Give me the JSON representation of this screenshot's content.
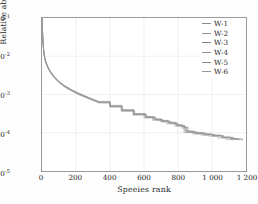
{
  "chart_data": {
    "type": "line",
    "title": "",
    "xlabel": "Speeies rank",
    "ylabel": "Relative abundance",
    "xlim": [
      0,
      1200
    ],
    "ylim": [
      1e-05,
      0.1
    ],
    "yscale": "log",
    "xscale": "linear",
    "grid": true,
    "legend_position": "upper-right",
    "xticks": [
      "0",
      "200",
      "400",
      "600",
      "800",
      "1 000",
      "1 200"
    ],
    "xtick_values": [
      0,
      200,
      400,
      600,
      800,
      1000,
      1200
    ],
    "ytick_exponents": [
      "-1",
      "-2",
      "-3",
      "-4",
      "-5"
    ],
    "ytick_values": [
      0.1,
      0.01,
      0.001,
      0.0001,
      1e-05
    ],
    "line_color": "#8d8d8d",
    "series": [
      {
        "name": "W-1",
        "color": "#8a8a8a",
        "x": [
          1,
          3,
          6,
          10,
          16,
          24,
          36,
          52,
          72,
          100,
          135,
          175,
          220,
          275,
          335,
          400,
          470,
          540,
          610,
          660,
          700,
          745,
          790,
          830,
          845,
          900,
          960,
          1000,
          1060,
          1120,
          1180
        ],
        "y": [
          0.098,
          0.045,
          0.024,
          0.0138,
          0.0092,
          0.0068,
          0.0051,
          0.0038,
          0.0029,
          0.00215,
          0.00165,
          0.0013,
          0.00104,
          0.00082,
          0.00064,
          0.0005,
          0.00039,
          0.00031,
          0.00026,
          0.000225,
          0.000205,
          0.000182,
          0.000158,
          0.000142,
          0.000108,
          9.85e-05,
          9.15e-05,
          8.55e-05,
          7.6e-05,
          6.9e-05,
          6.4e-05
        ]
      },
      {
        "name": "W-2",
        "color": "#909090",
        "x": [
          1,
          3,
          6,
          10,
          16,
          24,
          36,
          52,
          72,
          100,
          135,
          175,
          220,
          275,
          335,
          400,
          470,
          540,
          610,
          665,
          705,
          750,
          795,
          835,
          855,
          905,
          955,
          1010,
          1070,
          1130,
          1175
        ],
        "y": [
          0.097,
          0.043,
          0.0232,
          0.0133,
          0.0089,
          0.0066,
          0.0049,
          0.0037,
          0.00283,
          0.0021,
          0.0016,
          0.00127,
          0.00101,
          0.0008,
          0.00062,
          0.000485,
          0.000378,
          0.0003,
          0.000252,
          0.000218,
          0.000198,
          0.000176,
          0.000153,
          0.000137,
          0.000104,
          9.55e-05,
          8.9e-05,
          8.3e-05,
          7.45e-05,
          6.8e-05,
          6.35e-05
        ]
      },
      {
        "name": "W-3",
        "color": "#878787",
        "x": [
          1,
          3,
          6,
          10,
          16,
          24,
          36,
          52,
          72,
          100,
          135,
          175,
          220,
          275,
          335,
          400,
          470,
          540,
          605,
          655,
          700,
          740,
          785,
          825,
          840,
          890,
          945,
          995,
          1050,
          1105,
          1150
        ],
        "y": [
          0.1,
          0.047,
          0.0247,
          0.0142,
          0.0095,
          0.007,
          0.0052,
          0.00392,
          0.00298,
          0.0022,
          0.0017,
          0.00134,
          0.00107,
          0.00084,
          0.00066,
          0.00052,
          0.000402,
          0.000318,
          0.000266,
          0.000232,
          0.00021,
          0.000188,
          0.000163,
          0.000146,
          0.000112,
          0.000102,
          9.4e-05,
          8.75e-05,
          7.8e-05,
          7.05e-05,
          6.5e-05
        ]
      },
      {
        "name": "W-4",
        "color": "#949494",
        "x": [
          1,
          3,
          6,
          10,
          16,
          24,
          36,
          52,
          72,
          100,
          135,
          175,
          220,
          275,
          335,
          400,
          465,
          535,
          600,
          650,
          695,
          735,
          780,
          820,
          835,
          885,
          935,
          985,
          1035,
          1085,
          1120
        ],
        "y": [
          0.094,
          0.041,
          0.0222,
          0.0128,
          0.0086,
          0.0063,
          0.00472,
          0.00355,
          0.00272,
          0.00202,
          0.00155,
          0.00122,
          0.00097,
          0.00077,
          0.0006,
          0.00047,
          0.000365,
          0.00029,
          0.000244,
          0.000212,
          0.000192,
          0.000171,
          0.000148,
          0.000133,
          0.000101,
          9.25e-05,
          8.65e-05,
          8.05e-05,
          7.25e-05,
          6.65e-05,
          6.25e-05
        ]
      },
      {
        "name": "W-5",
        "color": "#8c8c8c",
        "x": [
          1,
          3,
          6,
          10,
          16,
          24,
          36,
          52,
          72,
          100,
          135,
          175,
          220,
          275,
          335,
          400,
          472,
          545,
          615,
          670,
          712,
          758,
          800,
          842,
          860,
          912,
          965,
          1015,
          1065,
          1115,
          1160
        ],
        "y": [
          0.099,
          0.046,
          0.024,
          0.0136,
          0.0091,
          0.0067,
          0.00502,
          0.00375,
          0.00288,
          0.00212,
          0.00163,
          0.00129,
          0.00103,
          0.00081,
          0.00063,
          0.000495,
          0.000385,
          0.000305,
          0.000256,
          0.000222,
          0.000201,
          0.000179,
          0.000155,
          0.000139,
          0.000106,
          9.7e-05,
          9.05e-05,
          8.45e-05,
          7.52e-05,
          6.85e-05,
          6.38e-05
        ]
      },
      {
        "name": "W-6",
        "color": "#9a9a9a",
        "x": [
          1,
          3,
          6,
          10,
          16,
          24,
          36,
          52,
          72,
          100,
          135,
          175,
          220,
          275,
          335,
          400,
          468,
          538,
          608,
          662,
          706,
          748,
          792,
          832,
          850,
          898,
          950,
          1005,
          1058,
          1108,
          1145
        ],
        "y": [
          0.096,
          0.044,
          0.0228,
          0.0131,
          0.0088,
          0.0065,
          0.00485,
          0.00365,
          0.00278,
          0.00206,
          0.00158,
          0.00125,
          0.00099,
          0.00078,
          0.00061,
          0.000478,
          0.000372,
          0.000295,
          0.000248,
          0.000215,
          0.000195,
          0.000174,
          0.000151,
          0.000135,
          0.000102,
          9.4e-05,
          8.78e-05,
          8.18e-05,
          7.35e-05,
          6.72e-05,
          6.3e-05
        ]
      }
    ]
  },
  "legend": {
    "items": [
      {
        "label": "W-1"
      },
      {
        "label": "W-2"
      },
      {
        "label": "W-3"
      },
      {
        "label": "W-4"
      },
      {
        "label": "W-5"
      },
      {
        "label": "W-6"
      }
    ]
  }
}
